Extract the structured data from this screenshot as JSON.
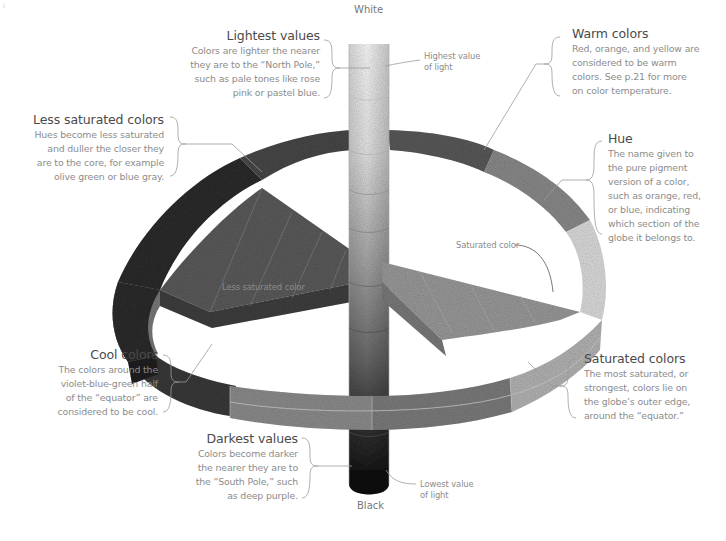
{
  "diagram": {
    "corner_mark": "i",
    "poles": {
      "top": "White",
      "bottom": "Black"
    },
    "small_labels": {
      "highest_value": [
        "Highest value",
        "of light"
      ],
      "lowest_value": [
        "Lowest value",
        "of light"
      ],
      "saturated_color": "Saturated color",
      "less_saturated_color": "Less saturated color"
    },
    "callouts": {
      "lightest_values": {
        "title": "Lightest values",
        "lines": [
          "Colors are lighter the nearer",
          "they are to the “North Pole,”",
          "such as pale tones like rose",
          "pink or pastel blue."
        ]
      },
      "less_saturated": {
        "title": "Less saturated colors",
        "lines": [
          "Hues become less saturated",
          "and duller the closer they",
          "are to the core, for example",
          "olive green or blue gray."
        ]
      },
      "warm_colors": {
        "title": "Warm colors",
        "lines": [
          "Red, orange, and yellow are",
          "considered to be warm",
          "colors. See p.21 for more",
          "on color temperature."
        ]
      },
      "hue": {
        "title": "Hue",
        "lines": [
          "The name given to",
          "the pure pigment",
          "version of a color,",
          "such as orange, red,",
          "or blue, indicating",
          "which section of the",
          "globe it belongs to."
        ]
      },
      "cool_colors": {
        "title": "Cool colors",
        "lines": [
          "The colors around the",
          "violet-blue-green half",
          "of the “equator” are",
          "considered to be cool."
        ]
      },
      "saturated_colors": {
        "title": "Saturated colors",
        "lines": [
          "The most saturated, or",
          "strongest, colors lie on",
          "the globe’s outer edge,",
          "around the “equator.”"
        ]
      },
      "darkest_values": {
        "title": "Darkest values",
        "lines": [
          "Colors become darker",
          "the nearer they are to",
          "the “South Pole,” such",
          "as deep purple."
        ]
      }
    },
    "colors": {
      "text_title": "#4a4a4a",
      "text_body": "#8c8c8c",
      "leader_line": "#9a9a9a",
      "column_top": "#f4f4f4",
      "column_bottom": "#1c1c1c"
    }
  }
}
